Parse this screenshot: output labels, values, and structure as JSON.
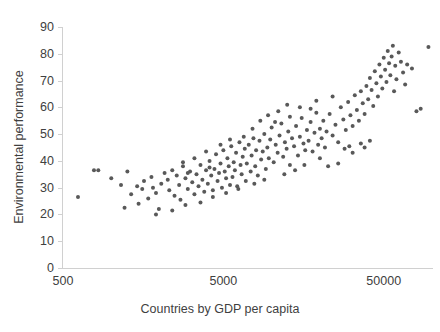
{
  "chart_data": {
    "type": "scatter",
    "title": "",
    "xlabel": "Countries by GDP per capita",
    "ylabel": "Environmental performance",
    "xscale": "log",
    "yscale": "linear",
    "xlim": [
      500,
      100000
    ],
    "ylim": [
      0,
      90
    ],
    "xticks": [
      500,
      5000,
      50000
    ],
    "xtick_labels": [
      "500",
      "5000",
      "50000"
    ],
    "yticks": [
      0,
      10,
      20,
      30,
      40,
      50,
      60,
      70,
      80,
      90
    ],
    "ytick_labels": [
      "0",
      "10",
      "20",
      "30",
      "40",
      "50",
      "60",
      "70",
      "80",
      "90"
    ],
    "grid": false,
    "legend": null,
    "marker_color": "#595959",
    "marker_size": 4,
    "series": [
      {
        "name": "Countries",
        "points": [
          [
            620,
            26.5
          ],
          [
            780,
            36.5
          ],
          [
            830,
            36.5
          ],
          [
            1000,
            33.5
          ],
          [
            1150,
            31.0
          ],
          [
            1210,
            22.5
          ],
          [
            1260,
            36.0
          ],
          [
            1330,
            27.5
          ],
          [
            1450,
            30.5
          ],
          [
            1480,
            24.0
          ],
          [
            1560,
            29.5
          ],
          [
            1600,
            32.5
          ],
          [
            1700,
            26.0
          ],
          [
            1780,
            34.0
          ],
          [
            1820,
            30.0
          ],
          [
            1900,
            28.0
          ],
          [
            1980,
            22.0
          ],
          [
            2050,
            31.5
          ],
          [
            2150,
            35.5
          ],
          [
            2250,
            33.0
          ],
          [
            2300,
            29.0
          ],
          [
            2400,
            36.5
          ],
          [
            2480,
            27.0
          ],
          [
            2560,
            34.5
          ],
          [
            2650,
            31.0
          ],
          [
            2700,
            25.5
          ],
          [
            2800,
            38.0
          ],
          [
            2900,
            33.5
          ],
          [
            3000,
            29.5
          ],
          [
            3100,
            36.0
          ],
          [
            3200,
            32.0
          ],
          [
            3300,
            27.5
          ],
          [
            3400,
            35.0
          ],
          [
            3500,
            30.5
          ],
          [
            3600,
            38.5
          ],
          [
            3700,
            33.0
          ],
          [
            3800,
            28.5
          ],
          [
            3900,
            36.5
          ],
          [
            4000,
            31.5
          ],
          [
            4100,
            40.0
          ],
          [
            4200,
            34.5
          ],
          [
            4300,
            29.0
          ],
          [
            4400,
            37.0
          ],
          [
            4500,
            42.5
          ],
          [
            4600,
            32.5
          ],
          [
            4700,
            35.5
          ],
          [
            4800,
            39.0
          ],
          [
            4900,
            30.0
          ],
          [
            5000,
            44.0
          ],
          [
            5100,
            36.0
          ],
          [
            5200,
            33.5
          ],
          [
            5300,
            41.0
          ],
          [
            5400,
            38.0
          ],
          [
            5500,
            31.0
          ],
          [
            5600,
            45.5
          ],
          [
            5700,
            34.0
          ],
          [
            5800,
            39.5
          ],
          [
            5900,
            36.5
          ],
          [
            6000,
            43.0
          ],
          [
            6100,
            30.5
          ],
          [
            6300,
            47.0
          ],
          [
            6400,
            38.5
          ],
          [
            6500,
            35.0
          ],
          [
            6600,
            41.5
          ],
          [
            6800,
            44.5
          ],
          [
            6900,
            32.5
          ],
          [
            7000,
            39.0
          ],
          [
            7200,
            46.0
          ],
          [
            7400,
            36.0
          ],
          [
            7500,
            42.0
          ],
          [
            7700,
            48.5
          ],
          [
            7900,
            38.0
          ],
          [
            8000,
            44.0
          ],
          [
            8200,
            34.5
          ],
          [
            8400,
            47.5
          ],
          [
            8600,
            40.5
          ],
          [
            8800,
            43.5
          ],
          [
            9000,
            50.0
          ],
          [
            9200,
            37.0
          ],
          [
            9400,
            45.0
          ],
          [
            9600,
            41.0
          ],
          [
            9800,
            48.0
          ],
          [
            10000,
            52.5
          ],
          [
            10300,
            39.5
          ],
          [
            10600,
            46.0
          ],
          [
            10900,
            43.0
          ],
          [
            11200,
            49.5
          ],
          [
            11500,
            54.0
          ],
          [
            11800,
            41.5
          ],
          [
            12100,
            47.0
          ],
          [
            12400,
            44.5
          ],
          [
            12700,
            51.0
          ],
          [
            13000,
            38.5
          ],
          [
            13400,
            48.5
          ],
          [
            13800,
            45.5
          ],
          [
            14200,
            53.0
          ],
          [
            14600,
            42.0
          ],
          [
            15000,
            49.0
          ],
          [
            15400,
            56.0
          ],
          [
            15800,
            46.5
          ],
          [
            16200,
            44.0
          ],
          [
            16600,
            51.5
          ],
          [
            17000,
            47.5
          ],
          [
            17500,
            54.5
          ],
          [
            18000,
            43.5
          ],
          [
            18500,
            50.5
          ],
          [
            19000,
            58.0
          ],
          [
            19500,
            46.0
          ],
          [
            20000,
            52.0
          ],
          [
            20500,
            48.5
          ],
          [
            21000,
            55.0
          ],
          [
            21500,
            45.0
          ],
          [
            22000,
            51.0
          ],
          [
            23000,
            57.5
          ],
          [
            24000,
            49.5
          ],
          [
            25000,
            53.5
          ],
          [
            26000,
            47.0
          ],
          [
            27000,
            60.0
          ],
          [
            28000,
            55.5
          ],
          [
            29000,
            51.5
          ],
          [
            30000,
            62.0
          ],
          [
            31000,
            57.0
          ],
          [
            32000,
            53.0
          ],
          [
            33000,
            64.5
          ],
          [
            34000,
            59.0
          ],
          [
            35000,
            55.0
          ],
          [
            36000,
            66.0
          ],
          [
            37000,
            61.5
          ],
          [
            38000,
            57.5
          ],
          [
            39000,
            68.0
          ],
          [
            40000,
            63.0
          ],
          [
            41000,
            71.0
          ],
          [
            42000,
            66.5
          ],
          [
            43000,
            60.5
          ],
          [
            44000,
            73.5
          ],
          [
            45000,
            69.0
          ],
          [
            46000,
            64.0
          ],
          [
            47000,
            76.0
          ],
          [
            48000,
            71.5
          ],
          [
            49000,
            67.0
          ],
          [
            50000,
            78.5
          ],
          [
            51000,
            74.0
          ],
          [
            52000,
            69.5
          ],
          [
            53000,
            81.0
          ],
          [
            54000,
            76.5
          ],
          [
            55000,
            72.0
          ],
          [
            56000,
            79.0
          ],
          [
            57000,
            83.0
          ],
          [
            58000,
            66.0
          ],
          [
            59000,
            75.5
          ],
          [
            60000,
            70.5
          ],
          [
            62000,
            80.5
          ],
          [
            64000,
            77.0
          ],
          [
            66000,
            73.0
          ],
          [
            68000,
            68.5
          ],
          [
            70000,
            76.0
          ],
          [
            75000,
            74.5
          ],
          [
            80000,
            58.5
          ],
          [
            85000,
            59.5
          ],
          [
            95000,
            82.5
          ],
          [
            28500,
            44.5
          ],
          [
            30500,
            45.5
          ],
          [
            32000,
            43.0
          ],
          [
            26000,
            39.0
          ],
          [
            20000,
            41.0
          ],
          [
            22500,
            38.0
          ],
          [
            36000,
            46.5
          ],
          [
            38000,
            45.0
          ],
          [
            41000,
            47.5
          ],
          [
            14000,
            36.5
          ],
          [
            16000,
            38.5
          ],
          [
            12000,
            35.0
          ],
          [
            9000,
            33.0
          ],
          [
            7800,
            31.5
          ],
          [
            6200,
            29.5
          ],
          [
            5200,
            28.0
          ],
          [
            4300,
            26.5
          ],
          [
            3600,
            24.5
          ],
          [
            2900,
            23.5
          ],
          [
            2400,
            21.5
          ],
          [
            1900,
            20.0
          ],
          [
            8500,
            55.0
          ],
          [
            9500,
            57.0
          ],
          [
            11000,
            58.5
          ],
          [
            13000,
            56.5
          ],
          [
            15000,
            60.0
          ],
          [
            17500,
            59.5
          ],
          [
            10500,
            54.5
          ],
          [
            7600,
            52.0
          ],
          [
            6700,
            49.0
          ],
          [
            12500,
            61.0
          ],
          [
            19000,
            62.5
          ],
          [
            24000,
            64.0
          ],
          [
            4800,
            46.0
          ],
          [
            5500,
            48.0
          ],
          [
            3900,
            43.5
          ],
          [
            3300,
            41.0
          ],
          [
            2800,
            39.5
          ],
          [
            4100,
            37.5
          ],
          [
            3000,
            35.5
          ]
        ]
      }
    ]
  },
  "axes": {
    "y_title": "Environmental performance",
    "x_title": "Countries by GDP per capita"
  }
}
